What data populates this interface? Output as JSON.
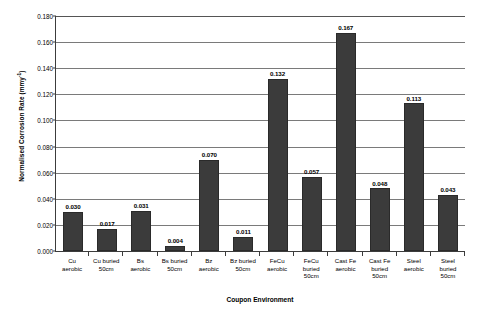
{
  "chart_data": {
    "type": "bar",
    "title": "",
    "xlabel": "Coupon Environment",
    "ylabel": "Normalised Corrosion Rate (mmy-1)",
    "ylabel_base": "Normalised Corrosion Rate (mmy",
    "ylabel_sup": "-1",
    "ylabel_tail": ")",
    "ylim": [
      0.0,
      0.18
    ],
    "ytick_step": 0.02,
    "ytick_labels": [
      "0.000",
      "0.020",
      "0.040",
      "0.060",
      "0.080",
      "0.100",
      "0.120",
      "0.140",
      "0.160",
      "0.180"
    ],
    "ytick_values": [
      0.0,
      0.02,
      0.04,
      0.06,
      0.08,
      0.1,
      0.12,
      0.14,
      0.16,
      0.18
    ],
    "grid": "horizontal",
    "legend": "none",
    "bar_color": "#3b3b3b",
    "categories": [
      "Cu aerobic",
      "Cu buried 50cm",
      "Bs aerobic",
      "Bs buried 50cm",
      "Bz aerobic",
      "Bz buried 50cm",
      "FeCu aerobic",
      "FeCu buried 50cm",
      "Cast Fe aerobic",
      "Cast Fe buried 50cm",
      "Steel aerobic",
      "Steel buried 50cm"
    ],
    "category_lines": [
      [
        "Cu",
        "aerobic"
      ],
      [
        "Cu buried",
        "50cm"
      ],
      [
        "Bs",
        "aerobic"
      ],
      [
        "Bs buried",
        "50cm"
      ],
      [
        "Bz",
        "aerobic"
      ],
      [
        "Bz buried",
        "50cm"
      ],
      [
        "FeCu",
        "aerobic"
      ],
      [
        "FeCu",
        "buried",
        "50cm"
      ],
      [
        "Cast Fe",
        "aerobic"
      ],
      [
        "Cast Fe",
        "buried",
        "50cm"
      ],
      [
        "Steel",
        "aerobic"
      ],
      [
        "Steel",
        "buried",
        "50cm"
      ]
    ],
    "values": [
      0.03,
      0.017,
      0.031,
      0.004,
      0.07,
      0.011,
      0.132,
      0.057,
      0.167,
      0.048,
      0.113,
      0.043
    ],
    "value_labels": [
      "0.030",
      "0.017",
      "0.031",
      "0.004",
      "0.070",
      "0.011",
      "0.132",
      "0.057",
      "0.167",
      "0.048",
      "0.113",
      "0.043"
    ]
  }
}
